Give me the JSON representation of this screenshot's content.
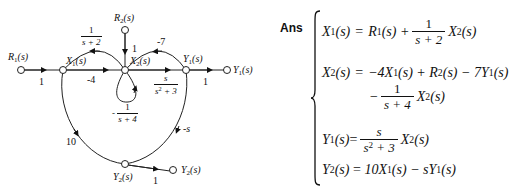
{
  "diagram": {
    "type": "signal-flow-graph",
    "nodes": {
      "R1_in": {
        "label": "R",
        "sub": "1",
        "arg": "(s)"
      },
      "X1": {
        "label": "X",
        "sub": "1",
        "arg": "(s)"
      },
      "X2": {
        "label": "X",
        "sub": "2",
        "arg": "(s)"
      },
      "Y1": {
        "label": "Y",
        "sub": "1",
        "arg": "(s)"
      },
      "Y1_out": {
        "label": "Y",
        "sub": "1",
        "arg": "(s)"
      },
      "R2_in": {
        "label": "R",
        "sub": "2",
        "arg": "(s)"
      },
      "Y2": {
        "label": "Y",
        "sub": "2",
        "arg": "(s)"
      },
      "Y2_out": {
        "label": "Y",
        "sub": "2",
        "arg": "(s)"
      }
    },
    "branches": {
      "R1_X1": "1",
      "X1_X2": "-4",
      "X2_X1": {
        "num": "1",
        "den": "s + 2"
      },
      "R2_X2": "1",
      "X2_Y1": {
        "num": "s",
        "den_base": "s",
        "den_sup": "2",
        "den_rest": " + 3"
      },
      "Y1_X2": "-7",
      "X2_X2_self": {
        "sign": "-",
        "num": "1",
        "den": "s + 4"
      },
      "Y1_Y1out": "1",
      "X1_Y2": "10",
      "Y1_Y2": "-s",
      "Y2_Y2out": "1"
    }
  },
  "answer": {
    "label": "Ans",
    "equations": {
      "eq1": {
        "lhs": "X",
        "lhs_sub": "1",
        "lhs_arg": "(s)",
        "rhs_a": "R",
        "rhs_a_sub": "1",
        "rhs_a_arg": "(s) +",
        "frac_num": "1",
        "frac_den": "s + 2",
        "rhs_b": "X",
        "rhs_b_sub": "2",
        "rhs_b_arg": "(s)"
      },
      "eq2": {
        "lhs": "X",
        "lhs_sub": "2",
        "lhs_arg": "(s)",
        "line1": "−4X",
        "line1_sub": "1",
        "line1_rest": "(s) + R",
        "line1_sub2": "2",
        "line1_rest2": "(s) − 7Y",
        "line1_sub3": "1",
        "line1_rest3": "(s)",
        "line2_sign": "−",
        "frac_num": "1",
        "frac_den": "s + 4",
        "line2_var": "X",
        "line2_sub": "2",
        "line2_arg": "(s)"
      },
      "eq3": {
        "lhs": "Y",
        "lhs_sub": "1",
        "lhs_arg": "(s)",
        "frac_num": "s",
        "frac_den_base": "s",
        "frac_den_sup": "2",
        "frac_den_rest": " + 3",
        "rhs": "X",
        "rhs_sub": "2",
        "rhs_arg": "(s)"
      },
      "eq4": {
        "lhs": "Y",
        "lhs_sub": "2",
        "lhs_arg": "(s)",
        "rhs1": "10X",
        "rhs1_sub": "1",
        "rhs1_rest": "(s) − sY",
        "rhs1_sub2": "1",
        "rhs1_rest2": "(s)"
      },
      "equals": "="
    }
  }
}
